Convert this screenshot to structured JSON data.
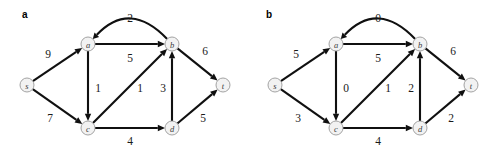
{
  "figure": {
    "background": "#ffffff",
    "edge_color": "#101010",
    "node_fill": "#f2f2f2",
    "node_stroke": "#9a9a9a",
    "label_color": "#1a1a1a"
  },
  "panels": [
    {
      "id": "a",
      "label": "a",
      "nodes": [
        {
          "id": "s",
          "label": "s",
          "x": 27,
          "y": 85
        },
        {
          "id": "a",
          "label": "a",
          "x": 88,
          "y": 44
        },
        {
          "id": "b",
          "label": "b",
          "x": 172,
          "y": 44
        },
        {
          "id": "c",
          "label": "c",
          "x": 88,
          "y": 128
        },
        {
          "id": "d",
          "label": "d",
          "x": 172,
          "y": 128
        },
        {
          "id": "t",
          "label": "t",
          "x": 223,
          "y": 85
        }
      ],
      "edges": [
        {
          "from": "s",
          "to": "a",
          "weight": "9",
          "lx": 48,
          "ly": 54,
          "curve": 0
        },
        {
          "from": "s",
          "to": "c",
          "weight": "7",
          "lx": 50,
          "ly": 118,
          "curve": 0
        },
        {
          "from": "a",
          "to": "b",
          "weight": "5",
          "lx": 130,
          "ly": 58,
          "curve": 0
        },
        {
          "from": "b",
          "to": "a",
          "weight": "2",
          "lx": 130,
          "ly": 18,
          "curve": -22
        },
        {
          "from": "a",
          "to": "c",
          "weight": "1",
          "lx": 98,
          "ly": 88,
          "curve": 0
        },
        {
          "from": "c",
          "to": "b",
          "weight": "1",
          "lx": 140,
          "ly": 88,
          "curve": 0
        },
        {
          "from": "c",
          "to": "d",
          "weight": "4",
          "lx": 130,
          "ly": 141,
          "curve": 0
        },
        {
          "from": "d",
          "to": "b",
          "weight": "3",
          "lx": 163,
          "ly": 88,
          "curve": 0
        },
        {
          "from": "b",
          "to": "t",
          "weight": "6",
          "lx": 205,
          "ly": 51,
          "curve": 0
        },
        {
          "from": "d",
          "to": "t",
          "weight": "5",
          "lx": 203,
          "ly": 118,
          "curve": 0
        }
      ]
    },
    {
      "id": "b",
      "label": "b",
      "nodes": [
        {
          "id": "s",
          "label": "s",
          "x": 27,
          "y": 85
        },
        {
          "id": "a",
          "label": "a",
          "x": 88,
          "y": 44
        },
        {
          "id": "b",
          "label": "b",
          "x": 172,
          "y": 44
        },
        {
          "id": "c",
          "label": "c",
          "x": 88,
          "y": 128
        },
        {
          "id": "d",
          "label": "d",
          "x": 172,
          "y": 128
        },
        {
          "id": "t",
          "label": "t",
          "x": 223,
          "y": 85
        }
      ],
      "edges": [
        {
          "from": "s",
          "to": "a",
          "weight": "5",
          "lx": 48,
          "ly": 54,
          "curve": 0
        },
        {
          "from": "s",
          "to": "c",
          "weight": "3",
          "lx": 50,
          "ly": 118,
          "curve": 0
        },
        {
          "from": "a",
          "to": "b",
          "weight": "5",
          "lx": 130,
          "ly": 58,
          "curve": 0
        },
        {
          "from": "b",
          "to": "a",
          "weight": "0",
          "lx": 130,
          "ly": 18,
          "curve": -22
        },
        {
          "from": "a",
          "to": "c",
          "weight": "0",
          "lx": 98,
          "ly": 88,
          "curve": 0
        },
        {
          "from": "c",
          "to": "b",
          "weight": "1",
          "lx": 140,
          "ly": 88,
          "curve": 0
        },
        {
          "from": "c",
          "to": "d",
          "weight": "4",
          "lx": 130,
          "ly": 141,
          "curve": 0
        },
        {
          "from": "d",
          "to": "b",
          "weight": "2",
          "lx": 163,
          "ly": 88,
          "curve": 0
        },
        {
          "from": "b",
          "to": "t",
          "weight": "6",
          "lx": 205,
          "ly": 51,
          "curve": 0
        },
        {
          "from": "d",
          "to": "t",
          "weight": "2",
          "lx": 203,
          "ly": 118,
          "curve": 0
        }
      ]
    }
  ],
  "panel_label_positions": [
    {
      "x": 22,
      "y": 9
    },
    {
      "x": 18,
      "y": 9
    }
  ]
}
